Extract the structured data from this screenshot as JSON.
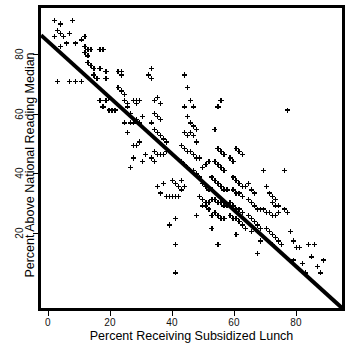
{
  "chart_data": {
    "type": "scatter",
    "title": "",
    "xlabel": "Percent Receiving Subsidized Lunch",
    "ylabel": "Percent Above National Reading Median",
    "xlim": [
      -3.5,
      96
    ],
    "ylim": [
      -2,
      92
    ],
    "xticks": [
      0,
      20,
      40,
      60,
      80
    ],
    "yticks": [
      20,
      40,
      60,
      80
    ],
    "grid": false,
    "legend": null,
    "marker": "plus",
    "marker_color": "#000000",
    "line_color": "#000000",
    "trendline": {
      "type": "linear-fit",
      "x_start": -3.5,
      "y_start": 83.5,
      "x_end": 96.0,
      "y_end": -2.0,
      "slope": -0.86,
      "intercept": 80.5
    },
    "points": [
      [
        1,
        88
      ],
      [
        3,
        87
      ],
      [
        2,
        85
      ],
      [
        3,
        84
      ],
      [
        1,
        83
      ],
      [
        4,
        83
      ],
      [
        7,
        88
      ],
      [
        6,
        84
      ],
      [
        5,
        81
      ],
      [
        3,
        80
      ],
      [
        8,
        81
      ],
      [
        2,
        69
      ],
      [
        6,
        69
      ],
      [
        8,
        69
      ],
      [
        10,
        69
      ],
      [
        10,
        82
      ],
      [
        11,
        83
      ],
      [
        11,
        80
      ],
      [
        12,
        79
      ],
      [
        12,
        77
      ],
      [
        12,
        75
      ],
      [
        11,
        78
      ],
      [
        13,
        79
      ],
      [
        13,
        74
      ],
      [
        14,
        73
      ],
      [
        14,
        71
      ],
      [
        15,
        70
      ],
      [
        16,
        79
      ],
      [
        17,
        79
      ],
      [
        16,
        73
      ],
      [
        18,
        72
      ],
      [
        18,
        70
      ],
      [
        19,
        64
      ],
      [
        18,
        63
      ],
      [
        16,
        63
      ],
      [
        17,
        61
      ],
      [
        19,
        60
      ],
      [
        20,
        60
      ],
      [
        21,
        60
      ],
      [
        22,
        72
      ],
      [
        23,
        71
      ],
      [
        23,
        72
      ],
      [
        22,
        67
      ],
      [
        23,
        66
      ],
      [
        24,
        65
      ],
      [
        24,
        63
      ],
      [
        25,
        62
      ],
      [
        25,
        61
      ],
      [
        26,
        59
      ],
      [
        24,
        56
      ],
      [
        26,
        56
      ],
      [
        27,
        56
      ],
      [
        25,
        53
      ],
      [
        27,
        63
      ],
      [
        28,
        63
      ],
      [
        28,
        62
      ],
      [
        29,
        63
      ],
      [
        28,
        57
      ],
      [
        29,
        56
      ],
      [
        30,
        58
      ],
      [
        27,
        49
      ],
      [
        28,
        49
      ],
      [
        29,
        50
      ],
      [
        26,
        42
      ],
      [
        27,
        45
      ],
      [
        30,
        44
      ],
      [
        31,
        46
      ],
      [
        32,
        71
      ],
      [
        33,
        73
      ],
      [
        33,
        70
      ],
      [
        34,
        63
      ],
      [
        35,
        64
      ],
      [
        36,
        62
      ],
      [
        34,
        59
      ],
      [
        35,
        58
      ],
      [
        36,
        57
      ],
      [
        33,
        56
      ],
      [
        34,
        54
      ],
      [
        35,
        53
      ],
      [
        36,
        52
      ],
      [
        37,
        51
      ],
      [
        38,
        50
      ],
      [
        34,
        47
      ],
      [
        35,
        46
      ],
      [
        36,
        46
      ],
      [
        37,
        46
      ],
      [
        38,
        47
      ],
      [
        33,
        45
      ],
      [
        34,
        44
      ],
      [
        37,
        37
      ],
      [
        35,
        36
      ],
      [
        36,
        34
      ],
      [
        38,
        33
      ],
      [
        39,
        33
      ],
      [
        40,
        38
      ],
      [
        41,
        37
      ],
      [
        42,
        36
      ],
      [
        43,
        38
      ],
      [
        40,
        33
      ],
      [
        41,
        33
      ],
      [
        42,
        33
      ],
      [
        43,
        35
      ],
      [
        44,
        36
      ],
      [
        39,
        24
      ],
      [
        41,
        26
      ],
      [
        41,
        18
      ],
      [
        41,
        9
      ],
      [
        44,
        71
      ],
      [
        45,
        67
      ],
      [
        46,
        63
      ],
      [
        44,
        61
      ],
      [
        47,
        61
      ],
      [
        45,
        58
      ],
      [
        46,
        56
      ],
      [
        47,
        55
      ],
      [
        48,
        54
      ],
      [
        44,
        53
      ],
      [
        45,
        52
      ],
      [
        46,
        53
      ],
      [
        47,
        52
      ],
      [
        48,
        50
      ],
      [
        43,
        49
      ],
      [
        44,
        48
      ],
      [
        45,
        47
      ],
      [
        46,
        47
      ],
      [
        47,
        46
      ],
      [
        48,
        45
      ],
      [
        49,
        45
      ],
      [
        43,
        44
      ],
      [
        44,
        43
      ],
      [
        45,
        42
      ],
      [
        46,
        41
      ],
      [
        47,
        41
      ],
      [
        48,
        40
      ],
      [
        49,
        39
      ],
      [
        50,
        42
      ],
      [
        51,
        43
      ],
      [
        52,
        44
      ],
      [
        50,
        37
      ],
      [
        51,
        36
      ],
      [
        52,
        35
      ],
      [
        53,
        35
      ],
      [
        49,
        33
      ],
      [
        50,
        32
      ],
      [
        51,
        31
      ],
      [
        52,
        31
      ],
      [
        50,
        30
      ],
      [
        51,
        30
      ],
      [
        52,
        29
      ],
      [
        48,
        27
      ],
      [
        53,
        27
      ],
      [
        54,
        54
      ],
      [
        55,
        61
      ],
      [
        56,
        63
      ],
      [
        55,
        48
      ],
      [
        56,
        47
      ],
      [
        57,
        46
      ],
      [
        54,
        44
      ],
      [
        55,
        43
      ],
      [
        56,
        42
      ],
      [
        57,
        41
      ],
      [
        53,
        39
      ],
      [
        54,
        38
      ],
      [
        55,
        37
      ],
      [
        56,
        36
      ],
      [
        57,
        35
      ],
      [
        58,
        35
      ],
      [
        53,
        32
      ],
      [
        54,
        32
      ],
      [
        55,
        31
      ],
      [
        56,
        31
      ],
      [
        57,
        30
      ],
      [
        58,
        30
      ],
      [
        54,
        28
      ],
      [
        55,
        27
      ],
      [
        56,
        26
      ],
      [
        57,
        26
      ],
      [
        53,
        23
      ],
      [
        55,
        18
      ],
      [
        59,
        45
      ],
      [
        60,
        44
      ],
      [
        61,
        48
      ],
      [
        62,
        47
      ],
      [
        63,
        46
      ],
      [
        60,
        39
      ],
      [
        61,
        38
      ],
      [
        62,
        37
      ],
      [
        63,
        36
      ],
      [
        64,
        36
      ],
      [
        60,
        35
      ],
      [
        61,
        34
      ],
      [
        62,
        34
      ],
      [
        63,
        33
      ],
      [
        59,
        31
      ],
      [
        60,
        30
      ],
      [
        61,
        29
      ],
      [
        62,
        29
      ],
      [
        63,
        28
      ],
      [
        59,
        27
      ],
      [
        60,
        26
      ],
      [
        61,
        26
      ],
      [
        62,
        25
      ],
      [
        63,
        24
      ],
      [
        64,
        23
      ],
      [
        61,
        21
      ],
      [
        65,
        37
      ],
      [
        66,
        35
      ],
      [
        67,
        34
      ],
      [
        65,
        32
      ],
      [
        66,
        31
      ],
      [
        67,
        30
      ],
      [
        68,
        29
      ],
      [
        69,
        29
      ],
      [
        65,
        27
      ],
      [
        66,
        26
      ],
      [
        67,
        25
      ],
      [
        68,
        24
      ],
      [
        69,
        23
      ],
      [
        66,
        22
      ],
      [
        68,
        22
      ],
      [
        69,
        19
      ],
      [
        68,
        15
      ],
      [
        70,
        41
      ],
      [
        71,
        36
      ],
      [
        72,
        34
      ],
      [
        73,
        33
      ],
      [
        74,
        32
      ],
      [
        73,
        31
      ],
      [
        74,
        30
      ],
      [
        75,
        30
      ],
      [
        70,
        29
      ],
      [
        71,
        28
      ],
      [
        72,
        28
      ],
      [
        73,
        27
      ],
      [
        74,
        27
      ],
      [
        75,
        28
      ],
      [
        71,
        23
      ],
      [
        72,
        22
      ],
      [
        73,
        21
      ],
      [
        74,
        20
      ],
      [
        75,
        19
      ],
      [
        73,
        18
      ],
      [
        76,
        18
      ],
      [
        78,
        60
      ],
      [
        77,
        41
      ],
      [
        77,
        29
      ],
      [
        78,
        28
      ],
      [
        79,
        22
      ],
      [
        80,
        19
      ],
      [
        81,
        17
      ],
      [
        82,
        17
      ],
      [
        80,
        13
      ],
      [
        83,
        12
      ],
      [
        85,
        18
      ],
      [
        87,
        18
      ],
      [
        86,
        14
      ],
      [
        88,
        11
      ],
      [
        89,
        9
      ],
      [
        90,
        13
      ],
      [
        84,
        9
      ]
    ]
  },
  "axes": {
    "x_tick_labels": [
      "0",
      "20",
      "40",
      "60",
      "80"
    ],
    "y_tick_labels": [
      "20",
      "40",
      "60",
      "80"
    ]
  }
}
